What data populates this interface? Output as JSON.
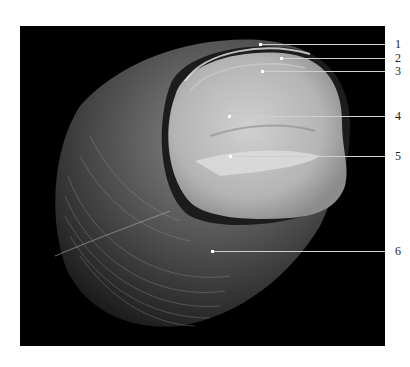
{
  "figure": {
    "background_color": "#000000",
    "page_color": "#ffffff"
  },
  "labels": [
    {
      "id": "1",
      "text": "1",
      "line_y": 44,
      "point_x": 260
    },
    {
      "id": "2",
      "text": "2",
      "line_y": 58,
      "point_x": 281
    },
    {
      "id": "3",
      "text": "3",
      "line_y": 71,
      "point_x": 262
    },
    {
      "id": "4",
      "text": "4",
      "line_y": 116,
      "point_x": 229
    },
    {
      "id": "5",
      "text": "5",
      "line_y": 156,
      "point_x": 230
    },
    {
      "id": "6",
      "text": "6",
      "line_y": 251,
      "point_x": 212
    }
  ]
}
